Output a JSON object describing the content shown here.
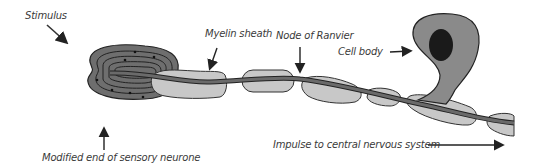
{
  "diagram": {
    "type": "sensory neurone with Pacinian-type receptor",
    "labels": {
      "stimulus": "Stimulus",
      "myelin_sheath": "Myelin sheath",
      "node_of_ranvier": "Node of Ranvier",
      "cell_body": "Cell body",
      "modified_end": "Modified end of sensory neurone",
      "impulse": "Impulse to central nervous system"
    },
    "colors": {
      "receptor": "#6e6e6e",
      "sheath": "#c8c8c8",
      "axon": "#5a5a5a",
      "cell_body": "#8a8a8a",
      "nucleus": "#1a1a1a",
      "outline": "#222222"
    }
  }
}
